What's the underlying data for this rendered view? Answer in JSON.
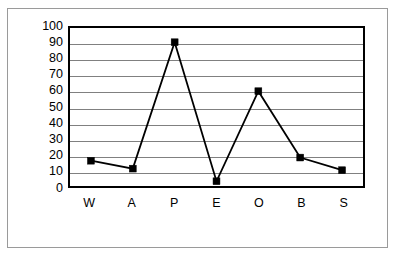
{
  "chart_data": {
    "type": "line",
    "title": "",
    "subtitle": "",
    "xlabel": "",
    "ylabel": "",
    "categories": [
      "W",
      "A",
      "P",
      "E",
      "O",
      "B",
      "S"
    ],
    "values": [
      16,
      11,
      91,
      3,
      60,
      18,
      10
    ],
    "series": [
      {
        "name": "",
        "values": [
          16,
          11,
          91,
          3,
          60,
          18,
          10
        ]
      }
    ],
    "ylim": [
      0,
      100
    ],
    "ytick_step": 10,
    "yticks": [
      0,
      10,
      20,
      30,
      40,
      50,
      60,
      70,
      80,
      90,
      100
    ],
    "ytick_labels": [
      "0",
      "10",
      "20",
      "30",
      "40",
      "50",
      "60",
      "70",
      "80",
      "90",
      "100"
    ],
    "grid": "horizontal",
    "legend": "none",
    "marker": "filled-square",
    "line_color": "#000000",
    "marker_color": "#000000",
    "grid_color": "#808080",
    "axis_color": "#000000",
    "frame_color": "#9a9a9a",
    "background": "#ffffff"
  }
}
